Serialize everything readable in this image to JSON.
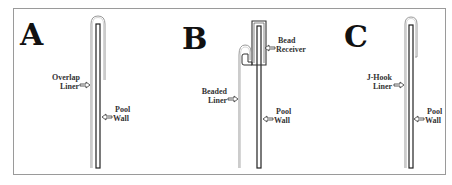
{
  "diagram": {
    "panels": [
      {
        "letter": "A",
        "liner_label": [
          "Overlap",
          "Liner"
        ],
        "wall_label": [
          "Pool",
          "Wall"
        ]
      },
      {
        "letter": "B",
        "liner_label": [
          "Beaded",
          "Liner"
        ],
        "wall_label": [
          "Pool",
          "Wall"
        ],
        "receiver_label": [
          "Bead",
          "Receiver"
        ]
      },
      {
        "letter": "C",
        "liner_label": [
          "J-Hook",
          "Liner"
        ],
        "wall_label": [
          "Pool",
          "Wall"
        ]
      }
    ],
    "colors": {
      "wall_stroke": "#222222",
      "liner_stroke": "#9a9a9a",
      "text": "#333333",
      "frame": "#9a9a9a"
    }
  }
}
